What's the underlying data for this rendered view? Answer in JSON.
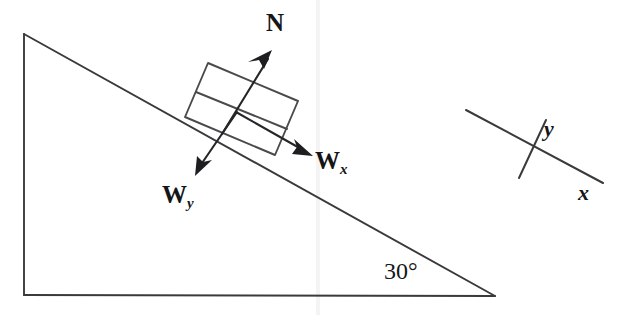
{
  "figure": {
    "background_color": "#ffffff",
    "line_color": "#3a3a3c",
    "text_color": "#151517"
  },
  "incline": {
    "angle_label": "30°",
    "apex_top": [
      24,
      34
    ],
    "corner_bottom_left": [
      24,
      295
    ],
    "corner_bottom_right": [
      495,
      296
    ]
  },
  "block": {
    "description": "tilted rectangular block resting on the incline surface",
    "corners": [
      [
        208,
        63
      ],
      [
        298,
        101
      ],
      [
        275,
        155
      ],
      [
        185,
        117
      ]
    ],
    "divider": [
      [
        196,
        92
      ],
      [
        287,
        129
      ]
    ]
  },
  "vectors": [
    {
      "name": "normal-force",
      "label": "N",
      "subscript": "",
      "from": [
        222,
        134
      ],
      "to": [
        272,
        52
      ],
      "label_pos": [
        266,
        10
      ]
    },
    {
      "name": "weight-x-component",
      "label": "W",
      "subscript": "x",
      "from": [
        236,
        112
      ],
      "to": [
        312,
        155
      ],
      "label_pos": [
        315,
        150
      ]
    },
    {
      "name": "weight-y-component",
      "label": "W",
      "subscript": "y",
      "from": [
        237,
        112
      ],
      "to": [
        196,
        174
      ],
      "label_pos": [
        162,
        182
      ]
    }
  ],
  "axes": {
    "description": "tilted coordinate axes aligned with the incline surface",
    "x_axis": {
      "label": "x",
      "from": [
        466,
        110
      ],
      "to": [
        603,
        183
      ],
      "label_pos": [
        578,
        182
      ]
    },
    "y_axis": {
      "label": "y",
      "from": [
        546,
        120
      ],
      "to": [
        519,
        178
      ],
      "label_pos": [
        544,
        118
      ]
    }
  }
}
